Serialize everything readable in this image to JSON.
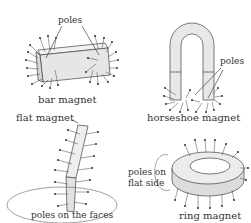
{
  "figure": {
    "bar": {
      "title": "bar magnet",
      "callout": "poles"
    },
    "horseshoe": {
      "title": "horseshoe magnet",
      "callout": "poles"
    },
    "flat": {
      "title": "flat magnet",
      "callout": "poles on the faces"
    },
    "ring": {
      "title": "ring magnet",
      "callout_line1": "poles on",
      "callout_line2": "flat side"
    }
  },
  "colors": {
    "stroke": "#444444",
    "fill": "#e8e8e8",
    "text": "#333333"
  }
}
